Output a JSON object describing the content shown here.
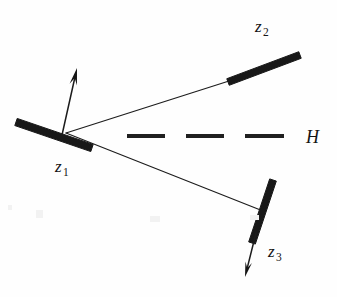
{
  "figure": {
    "background_color": "#fefefe",
    "ink_color": "#181818",
    "width": 337,
    "height": 297
  },
  "labels": {
    "z1": {
      "base": "z",
      "subscript": "1",
      "x": 55,
      "y": 172
    },
    "z2": {
      "base": "z",
      "subscript": "2",
      "x": 255,
      "y": 32
    },
    "z3": {
      "base": "z",
      "subscript": "3",
      "x": 268,
      "y": 257
    },
    "h": {
      "text": "H",
      "x": 306,
      "y": 143
    }
  },
  "mirrors": [
    {
      "name": "z1",
      "x1": 16,
      "y1": 122,
      "x2": 92,
      "y2": 148,
      "thickness": 7.5,
      "color": "#181818"
    },
    {
      "name": "z2",
      "x1": 228,
      "y1": 82,
      "x2": 300,
      "y2": 55,
      "thickness": 7.0,
      "color": "#181818"
    },
    {
      "name": "z3",
      "x1": 273,
      "y1": 180,
      "x2": 252,
      "y2": 243,
      "thickness": 7.0,
      "color": "#181818"
    }
  ],
  "rays": [
    {
      "name": "ray-to-z2",
      "x1": 66,
      "y1": 133,
      "x2": 229,
      "y2": 81
    },
    {
      "name": "ray-to-z3",
      "x1": 66,
      "y1": 133,
      "x2": 263,
      "y2": 211
    }
  ],
  "arrows": [
    {
      "name": "normal-arrow-z1",
      "x1": 62,
      "y1": 135,
      "x2": 77,
      "y2": 68,
      "head_size": 9
    },
    {
      "name": "normal-arrow-z3",
      "x1": 256,
      "y1": 233,
      "x2": 245,
      "y2": 277,
      "head_size": 8
    }
  ],
  "axis": {
    "name": "H",
    "y": 136,
    "dashes": [
      {
        "x1": 127,
        "x2": 165
      },
      {
        "x1": 186,
        "x2": 224
      },
      {
        "x1": 245,
        "x2": 284
      }
    ]
  },
  "vertex": {
    "x": 66,
    "y": 133
  }
}
